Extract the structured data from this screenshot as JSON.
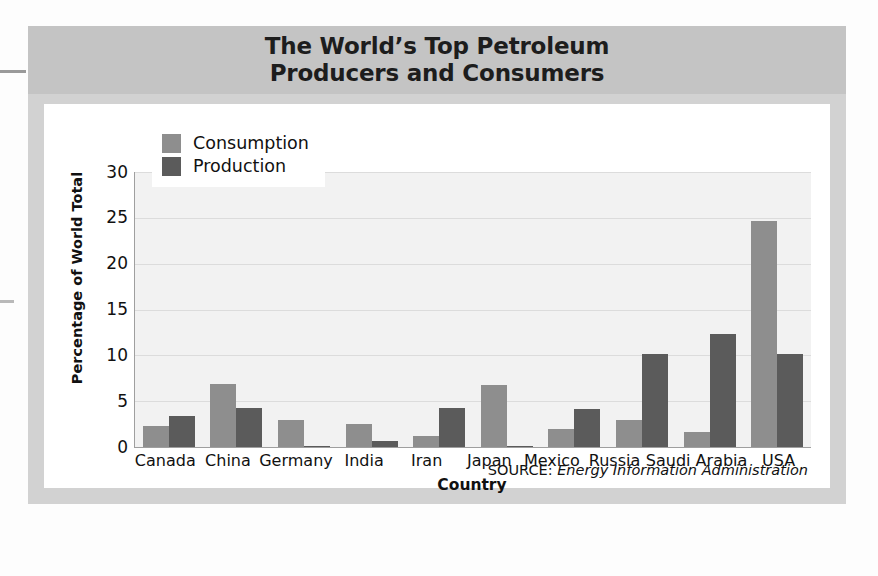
{
  "figure": {
    "title": "The World’s Top Petroleum\nProducers and Consumers",
    "source_label": "SOURCE:",
    "source_value": "Energy Information Administration"
  },
  "colors": {
    "consumption": "#8e8e8e",
    "production": "#5b5b5b",
    "panel": "#d2d2d2",
    "title_band": "#c4c4c4",
    "card": "#ffffff",
    "plot_background": "#f2f2f2",
    "gridline": "#dcdcdc",
    "axis": "#9f9f9f",
    "text": "#111111"
  },
  "legend": {
    "position": "top-left-inside",
    "entries": [
      {
        "label": "Consumption",
        "color": "#8e8e8e"
      },
      {
        "label": "Production",
        "color": "#5b5b5b"
      }
    ]
  },
  "axes": {
    "y_title": "Percentage of World Total",
    "x_title": "Country",
    "y_ticks": [
      "0",
      "5",
      "10",
      "15",
      "20",
      "25",
      "30"
    ],
    "y_min": 0,
    "y_max": 30
  },
  "chart_data": {
    "type": "bar",
    "title": "The World’s Top Petroleum Producers and Consumers",
    "subtitle": "",
    "xlabel": "Country",
    "ylabel": "Percentage of World Total",
    "ylim": [
      0,
      30
    ],
    "yticks": [
      0,
      5,
      10,
      15,
      20,
      25,
      30
    ],
    "grid": true,
    "legend_position": "upper left",
    "annotations": [
      "SOURCE: Energy Information Administration"
    ],
    "categories": [
      "Canada",
      "China",
      "Germany",
      "India",
      "Iran",
      "Japan",
      "Mexico",
      "Russia",
      "Saudi Arabia",
      "USA"
    ],
    "series": [
      {
        "name": "Consumption",
        "color": "#8e8e8e",
        "values": [
          2.3,
          6.9,
          3.0,
          2.5,
          1.2,
          6.8,
          2.0,
          2.9,
          1.6,
          24.7
        ]
      },
      {
        "name": "Production",
        "color": "#5b5b5b",
        "values": [
          3.4,
          4.3,
          0.15,
          0.7,
          4.3,
          0.1,
          4.2,
          10.2,
          12.3,
          10.2
        ]
      }
    ]
  }
}
